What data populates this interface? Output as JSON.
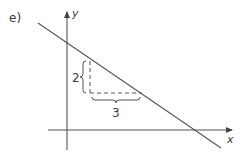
{
  "figure": {
    "part_label": "e)",
    "axes": {
      "x_label": "x",
      "y_label": "y"
    },
    "line": {
      "description": "straight line with negative slope, crossing positive y-axis and positive x-axis",
      "slope": "-2/3"
    },
    "slope_triangle": {
      "rise_label": "2",
      "run_label": "3",
      "style": "dashed"
    },
    "colors": {
      "stroke": "#444444",
      "background": "#ffffff"
    }
  }
}
